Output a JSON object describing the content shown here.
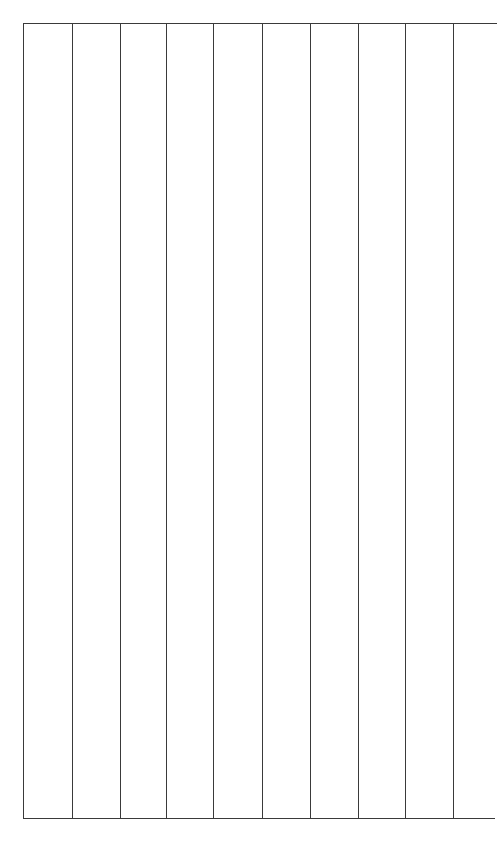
{
  "document": {
    "kind": "empty-ruled-table",
    "background_color": "#ffffff",
    "page_width": 500,
    "page_height": 847
  },
  "table": {
    "line_color": "#3a3a3a",
    "line_width_px": 1.5,
    "column_count": 9,
    "row_count": 1,
    "caption": "",
    "header_row": [],
    "rows": [
      [
        "",
        "",
        "",
        "",
        "",
        "",
        "",
        "",
        ""
      ]
    ],
    "rules": {
      "top": {
        "y": 23,
        "x_start": 23,
        "x_end": 497
      },
      "bottom": {
        "y": 818,
        "x_start": 23,
        "x_end": 495
      },
      "vertical_y_start": 23,
      "vertical_y_end": 818,
      "vertical_x_positions": [
        23,
        72,
        120,
        166,
        213,
        262,
        310,
        358,
        405,
        453
      ]
    },
    "columns": [
      {
        "index": 0,
        "label": "",
        "x_left": 23,
        "x_right": 72,
        "width": 49
      },
      {
        "index": 1,
        "label": "",
        "x_left": 72,
        "x_right": 120,
        "width": 48
      },
      {
        "index": 2,
        "label": "",
        "x_left": 120,
        "x_right": 166,
        "width": 46
      },
      {
        "index": 3,
        "label": "",
        "x_left": 166,
        "x_right": 213,
        "width": 47
      },
      {
        "index": 4,
        "label": "",
        "x_left": 213,
        "x_right": 262,
        "width": 49
      },
      {
        "index": 5,
        "label": "",
        "x_left": 262,
        "x_right": 310,
        "width": 48
      },
      {
        "index": 6,
        "label": "",
        "x_left": 310,
        "x_right": 358,
        "width": 48
      },
      {
        "index": 7,
        "label": "",
        "x_left": 358,
        "x_right": 405,
        "width": 47
      },
      {
        "index": 8,
        "label": "",
        "x_left": 405,
        "x_right": 453,
        "width": 48
      }
    ]
  }
}
